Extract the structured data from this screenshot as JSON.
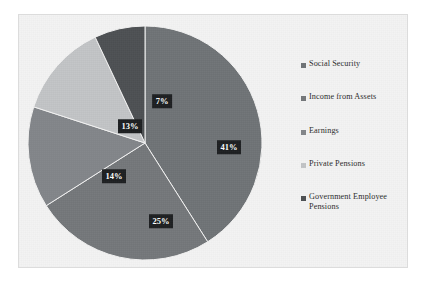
{
  "chart_data": {
    "type": "pie",
    "title": "",
    "subtitle": "",
    "xlabel": "",
    "ylabel": "",
    "grid": false,
    "legend_position": "right",
    "categories": [
      "Social Security",
      "Income from Assets",
      "Earnings",
      "Private Pensions",
      "Government Employee Pensions"
    ],
    "values": [
      41,
      25,
      14,
      13,
      7
    ],
    "value_labels": [
      "41%",
      "25%",
      "14%",
      "13%",
      "7%"
    ],
    "units": "percent",
    "colors": [
      "#6f7376",
      "#74777a",
      "#83868a",
      "#c2c4c6",
      "#4d5053"
    ]
  },
  "chart": {
    "slices": [
      {
        "label": "Social Security",
        "value": 41,
        "display": "41%",
        "color": "#6f7376",
        "label_x": 204,
        "label_y": 128
      },
      {
        "label": "Income from Assets",
        "value": 25,
        "display": "25%",
        "color": "#74777a",
        "label_x": 136,
        "label_y": 202
      },
      {
        "label": "Earnings",
        "value": 14,
        "display": "14%",
        "color": "#83868a",
        "label_x": 89,
        "label_y": 157
      },
      {
        "label": "Private Pensions",
        "value": 13,
        "display": "13%",
        "color": "#c2c4c6",
        "label_x": 105,
        "label_y": 107
      },
      {
        "label": "Government Employee Pensions",
        "value": 7,
        "display": "7%",
        "color": "#4d5053",
        "label_x": 137,
        "label_y": 82
      }
    ]
  },
  "legend": {
    "items": [
      {
        "label": "Social Security",
        "color": "#6f7376"
      },
      {
        "label": "Income from Assets",
        "color": "#74777a"
      },
      {
        "label": "Earnings",
        "color": "#83868a"
      },
      {
        "label": "Private Pensions",
        "color": "#c2c4c6"
      },
      {
        "label": "Government Employee Pensions",
        "color": "#4d5053"
      }
    ]
  },
  "theme": {
    "plot_background": "#f3f3f3",
    "page_background": "#ffffff",
    "frame_border": "#dcdcdc",
    "label_background": "#1d1f21",
    "label_text": "#ffffff"
  }
}
